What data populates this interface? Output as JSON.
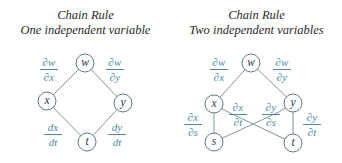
{
  "left": {
    "title_line1": "Chain Rule",
    "title_line2": "One independent variable",
    "nodes": [
      {
        "id": "w",
        "label": "w",
        "cx": 85,
        "cy": 63
      },
      {
        "id": "x",
        "label": "x",
        "cx": 47,
        "cy": 101
      },
      {
        "id": "y",
        "label": "y",
        "cx": 123,
        "cy": 103
      },
      {
        "id": "t",
        "label": "t",
        "cx": 87,
        "cy": 142
      }
    ],
    "edges": [
      [
        "w",
        "x"
      ],
      [
        "w",
        "y"
      ],
      [
        "x",
        "t"
      ],
      [
        "y",
        "t"
      ]
    ],
    "labels": {
      "dw_dx": {
        "num": "∂w",
        "den": "∂x"
      },
      "dw_dy": {
        "num": "∂w",
        "den": "∂y"
      },
      "dx_dt": {
        "num": "dx",
        "den": "dt"
      },
      "dy_dt": {
        "num": "dy",
        "den": "dt"
      }
    }
  },
  "right": {
    "title_line1": "Chain Rule",
    "title_line2": "Two independent variables",
    "nodes": [
      {
        "id": "w",
        "label": "w",
        "cx": 251,
        "cy": 63
      },
      {
        "id": "x",
        "label": "x",
        "cx": 214,
        "cy": 104
      },
      {
        "id": "y",
        "label": "y",
        "cx": 293,
        "cy": 103
      },
      {
        "id": "s",
        "label": "s",
        "cx": 214,
        "cy": 142
      },
      {
        "id": "t",
        "label": "t",
        "cx": 293,
        "cy": 143
      }
    ],
    "edges": [
      [
        "w",
        "x"
      ],
      [
        "w",
        "y"
      ],
      [
        "x",
        "s"
      ],
      [
        "x",
        "t"
      ],
      [
        "y",
        "s"
      ],
      [
        "y",
        "t"
      ]
    ],
    "labels": {
      "dw_dx": {
        "num": "∂w",
        "den": "∂x"
      },
      "dw_dy": {
        "num": "∂w",
        "den": "∂y"
      },
      "dx_ds": {
        "num": "∂x",
        "den": "∂s"
      },
      "dx_dt": {
        "num": "∂x",
        "den": "∂t"
      },
      "dy_ds": {
        "num": "∂y",
        "den": "∂s"
      },
      "dy_dt": {
        "num": "∂y",
        "den": "∂t"
      }
    }
  },
  "colors": {
    "title": "#2a2a2a",
    "edge": "#7f97a0",
    "node_stroke": "#5e7a85",
    "derivative_label": "#4b8aa8"
  }
}
